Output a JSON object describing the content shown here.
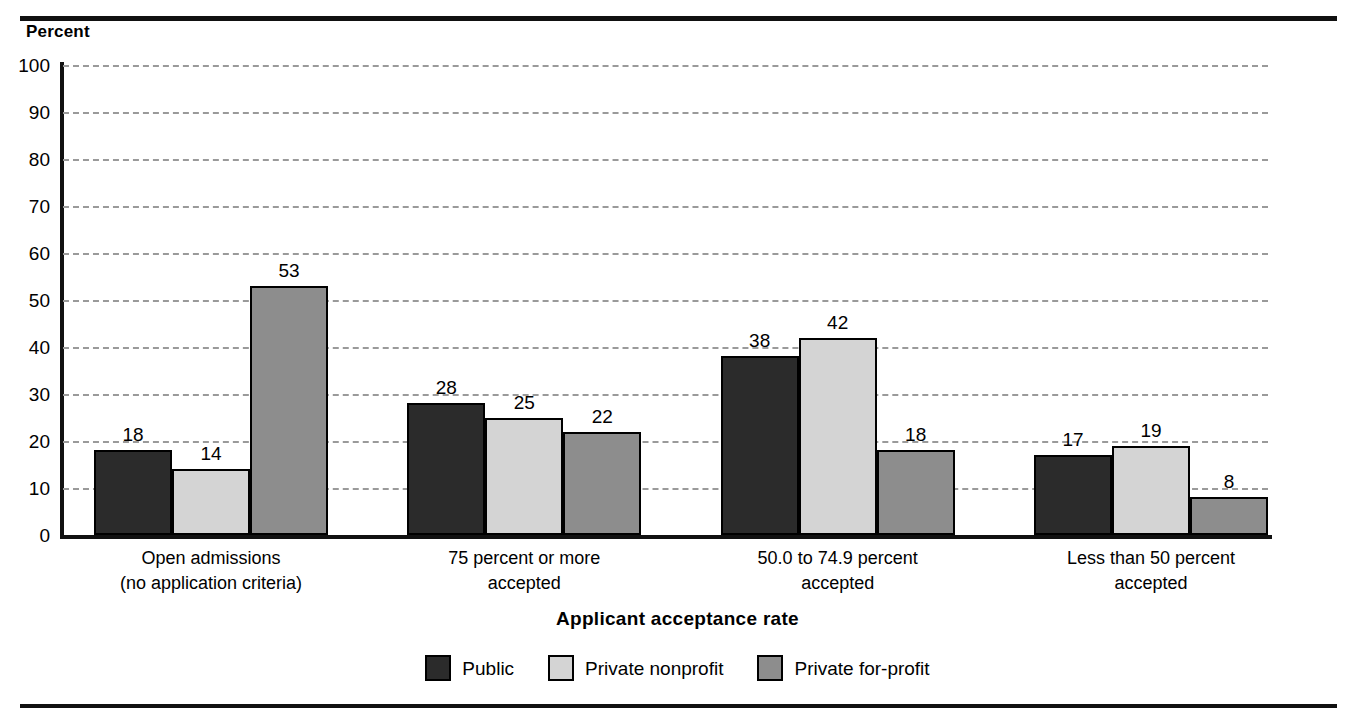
{
  "chart_data": {
    "type": "bar",
    "title": "",
    "ylabel": "Percent",
    "xlabel": "Applicant acceptance rate",
    "ylim": [
      0,
      100
    ],
    "ytick_step": 10,
    "yticks": [
      100,
      90,
      80,
      70,
      60,
      50,
      40,
      30,
      20,
      10,
      0
    ],
    "grid": true,
    "grid_style": "dashed",
    "legend_position": "bottom",
    "categories": [
      "Open admissions\n(no application criteria)",
      "75 percent or more\naccepted",
      "50.0 to 74.9 percent\naccepted",
      "Less than 50 percent\naccepted"
    ],
    "category_lines": [
      [
        "Open admissions",
        "(no application criteria)"
      ],
      [
        "75 percent or more",
        "accepted"
      ],
      [
        "50.0 to 74.9 percent",
        "accepted"
      ],
      [
        "Less than 50 percent",
        "accepted"
      ]
    ],
    "series": [
      {
        "name": "Public",
        "color": "#2b2b2b",
        "values": [
          18,
          28,
          38,
          17
        ]
      },
      {
        "name": "Private nonprofit",
        "color": "#d4d4d4",
        "values": [
          14,
          25,
          42,
          19
        ]
      },
      {
        "name": "Private for-profit",
        "color": "#8d8d8d",
        "values": [
          53,
          22,
          18,
          8
        ]
      }
    ]
  },
  "axis": {
    "unit_caption": "Percent",
    "x_title": "Applicant acceptance rate"
  },
  "legend": {
    "items": [
      {
        "label": "Public"
      },
      {
        "label": "Private nonprofit"
      },
      {
        "label": "Private for-profit"
      }
    ]
  }
}
